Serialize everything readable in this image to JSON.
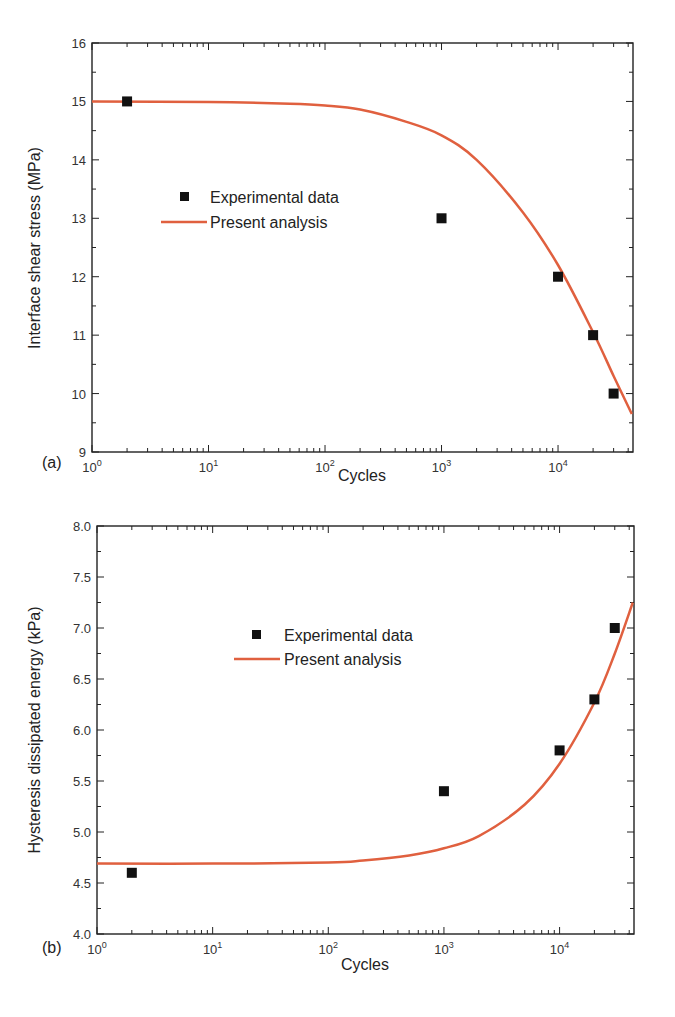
{
  "colors": {
    "curve": "#e0603f",
    "marker": "#111111",
    "axis": "#222222"
  },
  "chart_data": [
    {
      "panel": "(a)",
      "type": "scatter+line",
      "xlabel": "Cycles",
      "ylabel": "Interface shear stress (MPa)",
      "xscale": "log",
      "xlim": [
        1,
        44000
      ],
      "ylim": [
        9,
        16
      ],
      "xticks": [
        1,
        10,
        100,
        1000,
        10000
      ],
      "xtick_labels": [
        "10^0",
        "10^1",
        "10^2",
        "10^3",
        "10^4"
      ],
      "yticks": [
        9,
        10,
        11,
        12,
        13,
        14,
        15,
        16
      ],
      "ytick_labels": [
        "9",
        "10",
        "11",
        "12",
        "13",
        "14",
        "15",
        "16"
      ],
      "yminor_step": 0.5,
      "legend": {
        "position": "upper-left-center",
        "entries": [
          "Experimental data",
          "Present analysis"
        ]
      },
      "series": [
        {
          "name": "Experimental data",
          "kind": "scatter",
          "x": [
            2,
            1000,
            10000,
            20000,
            30000
          ],
          "y": [
            15.0,
            13.0,
            12.0,
            11.0,
            10.0
          ]
        },
        {
          "name": "Present analysis",
          "kind": "line",
          "x": [
            1,
            10,
            50,
            100,
            200,
            500,
            1000,
            2000,
            5000,
            10000,
            20000,
            30000,
            43000
          ],
          "y": [
            15.0,
            14.99,
            14.96,
            14.93,
            14.86,
            14.65,
            14.42,
            14.0,
            13.1,
            12.2,
            11.05,
            10.3,
            9.65
          ]
        }
      ]
    },
    {
      "panel": "(b)",
      "type": "scatter+line",
      "xlabel": "Cycles",
      "ylabel": "Hysteresis dissipated energy (kPa)",
      "xscale": "log",
      "xlim": [
        1,
        44000
      ],
      "ylim": [
        4.0,
        8.0
      ],
      "xticks": [
        1,
        10,
        100,
        1000,
        10000
      ],
      "xtick_labels": [
        "10^0",
        "10^1",
        "10^2",
        "10^3",
        "10^4"
      ],
      "yticks": [
        4.0,
        4.5,
        5.0,
        5.5,
        6.0,
        6.5,
        7.0,
        7.5,
        8.0
      ],
      "ytick_labels": [
        "4.0",
        "4.5",
        "5.0",
        "5.5",
        "6.0",
        "6.5",
        "7.0",
        "7.5",
        "8.0"
      ],
      "yminor_step": 0.25,
      "legend": {
        "position": "upper-left-center",
        "entries": [
          "Experimental data",
          "Present analysis"
        ]
      },
      "series": [
        {
          "name": "Experimental data",
          "kind": "scatter",
          "x": [
            2,
            1000,
            10000,
            20000,
            30000
          ],
          "y": [
            4.6,
            5.4,
            5.8,
            6.3,
            7.0
          ]
        },
        {
          "name": "Present analysis",
          "kind": "line",
          "x": [
            1,
            10,
            100,
            200,
            500,
            1000,
            2000,
            5000,
            10000,
            20000,
            30000,
            43000
          ],
          "y": [
            4.69,
            4.69,
            4.7,
            4.72,
            4.77,
            4.84,
            4.96,
            5.27,
            5.67,
            6.27,
            6.75,
            7.25
          ]
        }
      ]
    }
  ],
  "panels": [
    {
      "label": "(a)",
      "xlabel": "Cycles",
      "ylabel": "Interface shear stress (MPa)",
      "legend_marker": "Experimental data",
      "legend_line": "Present analysis"
    },
    {
      "label": "(b)",
      "xlabel": "Cycles",
      "ylabel": "Hysteresis dissipated energy (kPa)",
      "legend_marker": "Experimental data",
      "legend_line": "Present analysis"
    }
  ]
}
